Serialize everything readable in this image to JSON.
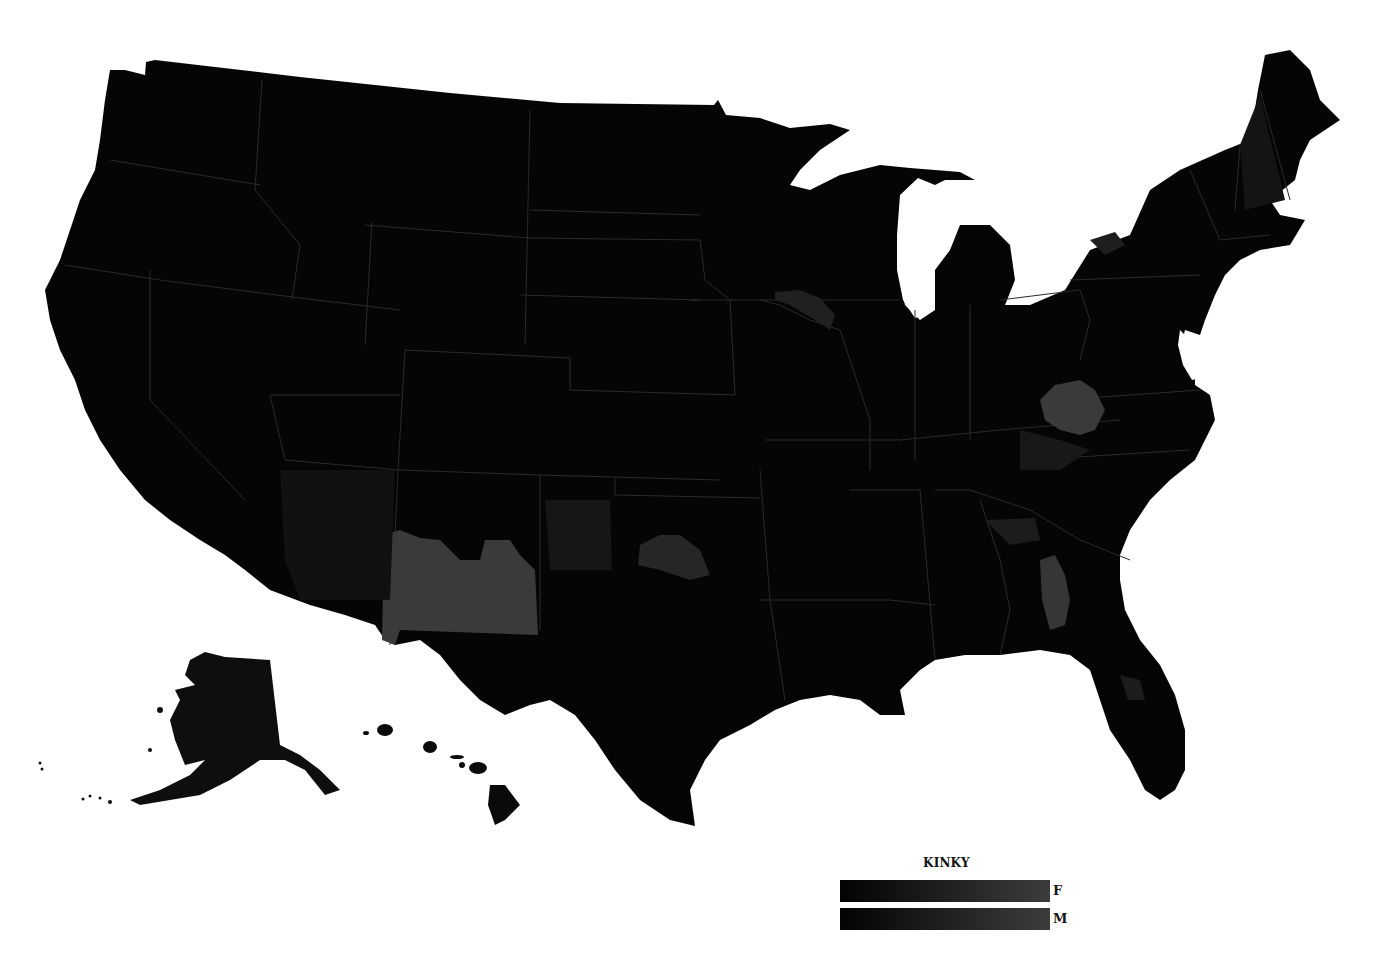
{
  "map": {
    "type": "choropleth",
    "subject": "United States counties",
    "background_color": "#ffffff",
    "base_fill": "#050505",
    "border_color": "#3a3a3a",
    "highlight_fills": {
      "low": "#1a1a1a",
      "mid": "#262626",
      "high": "#3a3a3a"
    },
    "highlighted_regions": [
      {
        "name": "New Mexico (central/southern)",
        "level": "high"
      },
      {
        "name": "West Virginia",
        "level": "high"
      },
      {
        "name": "Central Georgia",
        "level": "high"
      },
      {
        "name": "Central Oklahoma",
        "level": "mid"
      },
      {
        "name": "Texas Panhandle",
        "level": "low"
      },
      {
        "name": "Northeast Iowa / SW Wisconsin",
        "level": "low"
      },
      {
        "name": "Western New York",
        "level": "low"
      },
      {
        "name": "New Hampshire",
        "level": "low"
      },
      {
        "name": "Eastern Kentucky / Virginia",
        "level": "low"
      },
      {
        "name": "Arizona",
        "level": "low"
      },
      {
        "name": "Alaska",
        "level": "low"
      },
      {
        "name": "North Florida coast",
        "level": "low"
      }
    ]
  },
  "legend": {
    "title": "KINKY",
    "items": [
      {
        "label": "F",
        "gradient_start": "#030303",
        "gradient_end": "#3c3c3c"
      },
      {
        "label": "M",
        "gradient_start": "#030303",
        "gradient_end": "#3c3c3c"
      }
    ]
  }
}
